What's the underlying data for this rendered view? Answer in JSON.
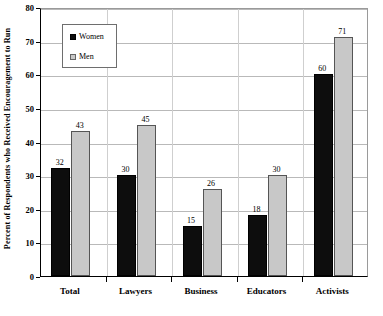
{
  "chart_data": {
    "type": "bar",
    "title": "",
    "subtitle": "",
    "xlabel": "",
    "ylabel": "Percent of Respondents who Received Encouragement to Run",
    "ylim": [
      0,
      80
    ],
    "yticks": [
      0,
      10,
      20,
      30,
      40,
      50,
      60,
      70,
      80
    ],
    "ytick_labels": [
      "0",
      "10",
      "20",
      "30",
      "40",
      "50",
      "60",
      "70",
      "80"
    ],
    "grid": "horizontal",
    "legend_position": "upper-left-inside",
    "categories": [
      "Total",
      "Lawyers",
      "Business",
      "Educators",
      "Activists"
    ],
    "series": [
      {
        "name": "Women",
        "color": "#0d0d0d",
        "values": [
          32,
          30,
          15,
          18,
          60
        ],
        "labels": [
          "32",
          "30",
          "15",
          "18",
          "60"
        ]
      },
      {
        "name": "Men",
        "color": "#c8c8c8",
        "values": [
          43,
          45,
          26,
          30,
          71
        ],
        "labels": [
          "43",
          "45",
          "26",
          "30",
          "71"
        ]
      }
    ]
  },
  "legend": {
    "entries": [
      {
        "label": "Women",
        "swatch": "women"
      },
      {
        "label": "Men",
        "swatch": "men"
      }
    ]
  },
  "colors": {
    "women_bar": "#0d0d0d",
    "men_bar": "#c8c8c8",
    "gridline": "#b9b9b9",
    "axis": "#000000",
    "background": "#ffffff"
  }
}
